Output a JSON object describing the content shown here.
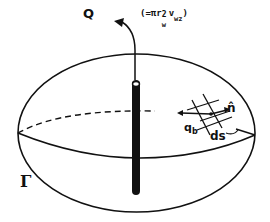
{
  "figure": {
    "type": "diagram"
  },
  "labels": {
    "discharge": "Q",
    "discharge_expression": "(=πr",
    "discharge_expression_sup": "2",
    "discharge_expression_sub_w": "w",
    "discharge_expression_v": "v",
    "discharge_expression_sub_wz": "wz",
    "discharge_expression_close": ")",
    "boundary": "Γ",
    "boundary_flux": "q",
    "boundary_flux_sub": "b",
    "normal_vector": "n̂",
    "surface_element": "ds"
  },
  "colors": {
    "ink": "#111111",
    "background": "#ffffff"
  }
}
